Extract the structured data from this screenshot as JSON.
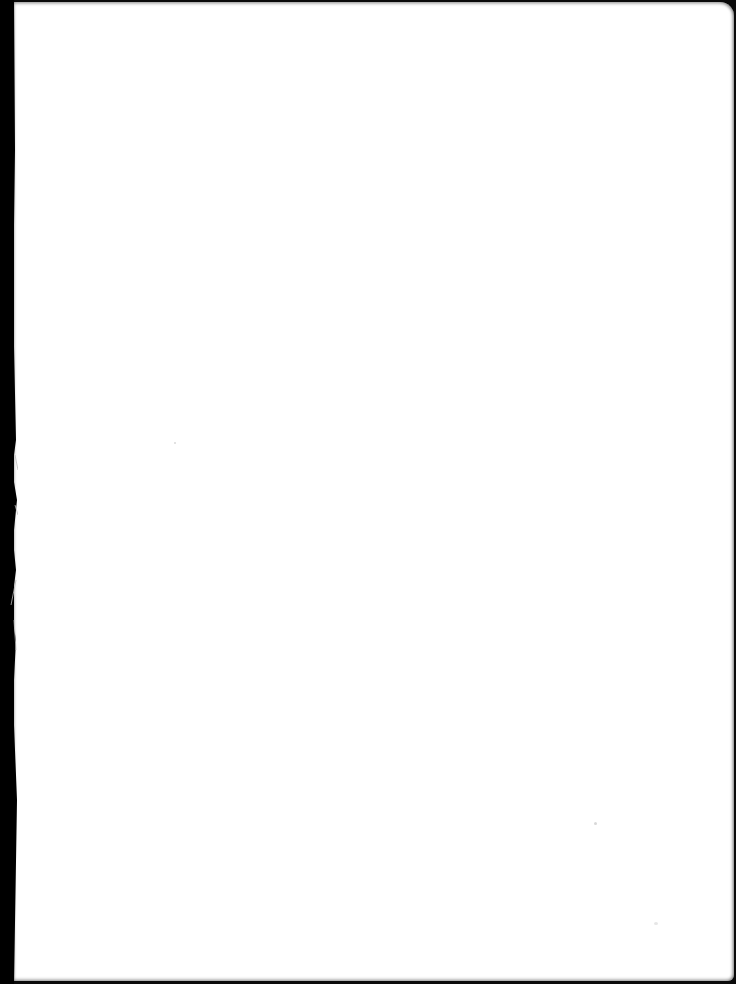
{
  "document": {
    "type": "scanned-page",
    "content": "",
    "state": "blank"
  },
  "colors": {
    "paper": "#ffffff",
    "background_edge": "#000000"
  }
}
